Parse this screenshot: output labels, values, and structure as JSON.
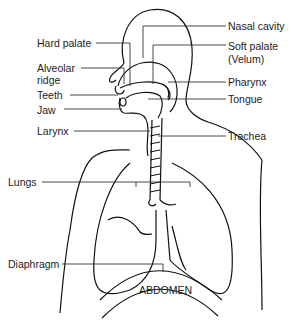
{
  "diagram": {
    "type": "anatomical-diagram",
    "labels_left": [
      {
        "id": "hard-palate",
        "text": "Hard palate"
      },
      {
        "id": "alveolar-ridge",
        "text": "Alveolar ridge"
      },
      {
        "id": "teeth",
        "text": "Teeth"
      },
      {
        "id": "jaw",
        "text": "Jaw"
      },
      {
        "id": "larynx",
        "text": "Larynx"
      },
      {
        "id": "lungs",
        "text": "Lungs"
      },
      {
        "id": "diaphragm",
        "text": "Diaphragm"
      }
    ],
    "labels_right": [
      {
        "id": "nasal-cavity",
        "text": "Nasal cavity"
      },
      {
        "id": "soft-palate",
        "text": "Soft palate (Velum)"
      },
      {
        "id": "pharynx",
        "text": "Pharynx"
      },
      {
        "id": "tongue",
        "text": "Tongue"
      },
      {
        "id": "trachea",
        "text": "Trachea"
      }
    ],
    "center_label": "ABDOMEN"
  },
  "labels": {
    "hard_palate": "Hard palate",
    "alveolar_line1": "Alveolar",
    "alveolar_line2": "ridge",
    "teeth": "Teeth",
    "jaw": "Jaw",
    "larynx": "Larynx",
    "lungs": "Lungs",
    "diaphragm": "Diaphragm",
    "nasal_cavity": "Nasal cavity",
    "soft_palate_line1": "Soft palate",
    "soft_palate_line2": "(Velum)",
    "pharynx": "Pharynx",
    "tongue": "Tongue",
    "trachea": "Trachea",
    "abdomen": "ABDOMEN"
  }
}
